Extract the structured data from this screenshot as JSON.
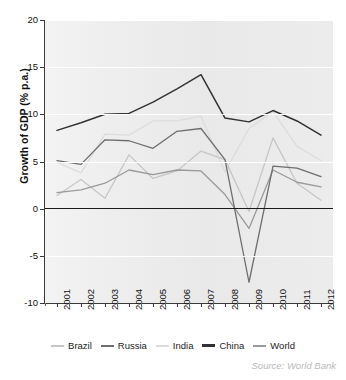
{
  "source_note": "Source: World Bank",
  "legend": {
    "position": "bottom",
    "items": [
      {
        "label": "Brazil",
        "color": "#c6c6c6"
      },
      {
        "label": "Russia",
        "color": "#6e6e6e"
      },
      {
        "label": "India",
        "color": "#dcdcdc"
      },
      {
        "label": "China",
        "color": "#333333"
      },
      {
        "label": "World",
        "color": "#9a9a9a"
      }
    ]
  },
  "chart_data": {
    "type": "line",
    "title": "",
    "xlabel": "",
    "ylabel": "Growth of GDP (% p.a.)",
    "ylim": [
      -10,
      20
    ],
    "yticks": [
      -10,
      -5,
      0,
      5,
      10,
      15,
      20
    ],
    "ytick_labels": [
      "-10",
      "-5",
      "0",
      "5",
      "10",
      "15",
      "20"
    ],
    "grid": true,
    "zero_line": true,
    "x": [
      2001,
      2002,
      2003,
      2004,
      2005,
      2006,
      2007,
      2008,
      2009,
      2010,
      2011,
      2012
    ],
    "categories": [
      "2001",
      "2002",
      "2003",
      "2004",
      "2005",
      "2006",
      "2007",
      "2008",
      "2009",
      "2010",
      "2011",
      "2012"
    ],
    "series": [
      {
        "name": "Brazil",
        "color": "#c6c6c6",
        "values": [
          1.4,
          3.1,
          1.1,
          5.7,
          3.2,
          4.0,
          6.1,
          5.2,
          -0.3,
          7.5,
          2.7,
          0.9
        ]
      },
      {
        "name": "Russia",
        "color": "#6e6e6e",
        "values": [
          5.1,
          4.7,
          7.3,
          7.2,
          6.4,
          8.2,
          8.5,
          5.2,
          -7.8,
          4.5,
          4.3,
          3.4
        ]
      },
      {
        "name": "India",
        "color": "#dcdcdc",
        "values": [
          4.9,
          3.8,
          7.9,
          7.8,
          9.3,
          9.3,
          9.8,
          3.9,
          8.5,
          10.3,
          6.6,
          5.1
        ]
      },
      {
        "name": "China",
        "color": "#333333",
        "values": [
          8.3,
          9.1,
          10.0,
          10.1,
          11.3,
          12.7,
          14.2,
          9.6,
          9.2,
          10.4,
          9.3,
          7.8
        ]
      },
      {
        "name": "World",
        "color": "#9a9a9a",
        "values": [
          1.7,
          2.0,
          2.7,
          4.1,
          3.6,
          4.1,
          4.0,
          1.5,
          -2.1,
          4.1,
          2.8,
          2.3
        ]
      }
    ]
  }
}
